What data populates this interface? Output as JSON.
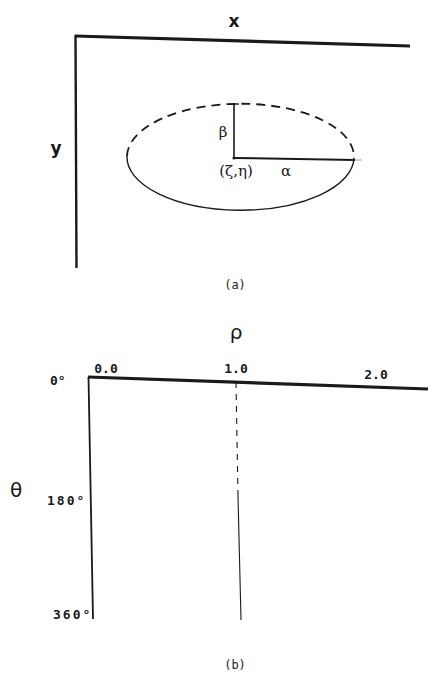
{
  "panel_a": {
    "x_axis_label": "x",
    "y_axis_label": "y",
    "center_label": "(ζ,η)",
    "semi_major_label": "α",
    "semi_minor_label": "β",
    "caption": "(a)",
    "ellipse": {
      "upper_half_style": "dashed",
      "lower_half_style": "solid"
    }
  },
  "panel_b": {
    "x_axis_label": "ρ",
    "y_axis_label": "θ",
    "x_ticks": [
      "0.0",
      "1.0",
      "2.0"
    ],
    "y_ticks": [
      "0°",
      "180°",
      "360°"
    ],
    "caption": "(b)",
    "reference_line": {
      "at_rho": "1.0",
      "upper_style": "dashed",
      "lower_style": "solid"
    }
  },
  "colors": {
    "ink": "#1a1a1a",
    "background": "#ffffff"
  }
}
